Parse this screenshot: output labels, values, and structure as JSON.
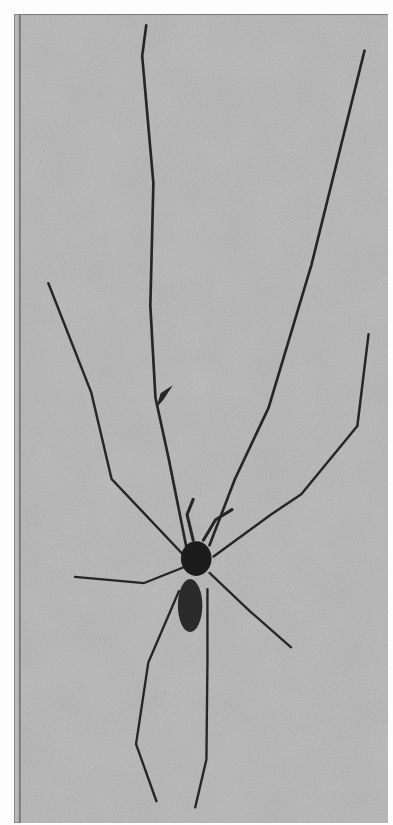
{
  "image": {
    "description": "Halftone photograph of a long-legged cellar spider on a mottled gray background",
    "subject": "spider",
    "background_color": "#b9b9b9",
    "page_color": "#fdfdfd",
    "leg_color": "#2a2a2a",
    "body_color": "#1c1c1c"
  }
}
